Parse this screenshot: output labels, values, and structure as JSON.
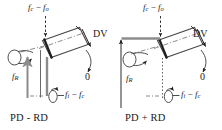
{
  "figure": {
    "title": "",
    "background_color": "#ffffff",
    "ink_color": "#1f1f1f",
    "accent_gray": "#8c8c8c"
  },
  "panels": [
    {
      "id": "left",
      "caption": "PD - RD",
      "labels": {
        "top_force": {
          "base": "f",
          "sub1": "c",
          "op": " − ",
          "base2": "f",
          "sub2": "o"
        },
        "left_force": {
          "base": "f",
          "sub1": "R"
        },
        "bottom_force": {
          "base": "f",
          "sub1": "i",
          "op": " − ",
          "base2": "f",
          "sub2": "c"
        },
        "dv": "DV",
        "zero": "0"
      }
    },
    {
      "id": "right",
      "caption": "PD + RD",
      "labels": {
        "top_force": {
          "base": "f",
          "sub1": "c",
          "op": " − ",
          "base2": "f",
          "sub2": "o"
        },
        "left_force": {
          "base": "f",
          "sub1": "R"
        },
        "bottom_force": {
          "base": "f",
          "sub1": "i",
          "op": " − ",
          "base2": "f",
          "sub2": "c"
        },
        "dv": "DV",
        "zero": "0"
      }
    }
  ],
  "icons": {
    "rotation_arrow": "curved-rotation-arrow-icon",
    "down_arrow": "down-arrow-icon",
    "up_arrow": "up-arrow-icon",
    "tilted_box": "tilted-box-icon"
  }
}
